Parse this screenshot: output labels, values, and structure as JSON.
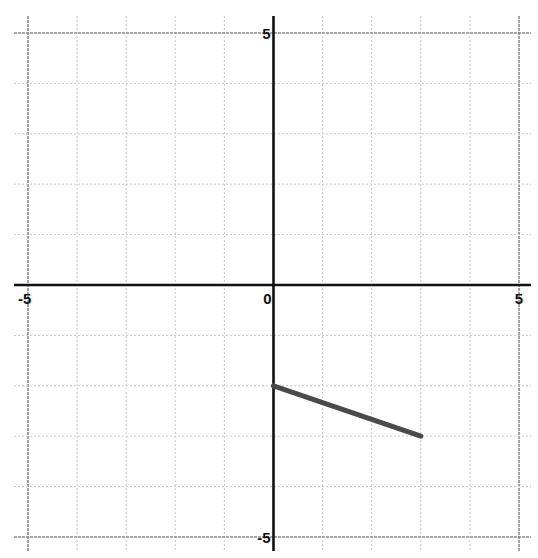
{
  "chart_data": {
    "type": "line",
    "title": "",
    "xlabel": "",
    "ylabel": "",
    "xlim": [
      -5,
      5
    ],
    "ylim": [
      -5,
      5
    ],
    "grid": true,
    "grid_step": 1,
    "x_tick_labels": [
      {
        "value": -5,
        "label": "-5"
      },
      {
        "value": 0,
        "label": "0"
      },
      {
        "value": 5,
        "label": "5"
      }
    ],
    "y_tick_labels": [
      {
        "value": 5,
        "label": "5"
      },
      {
        "value": -5,
        "label": "-5"
      }
    ],
    "series": [
      {
        "name": "segment",
        "x": [
          0,
          3
        ],
        "y": [
          -2,
          -3
        ],
        "color": "#4a4a4a",
        "width": 5
      }
    ]
  },
  "layout": {
    "x_min_px": 28,
    "x_max_px": 519,
    "y_top_px": 33,
    "y_bottom_px": 537,
    "grid_extent": {
      "left": 14,
      "right": 531,
      "top": 16,
      "bottom": 551
    },
    "colors": {
      "axis": "#111111",
      "grid": "#c8c8c8",
      "grid_outer": "#8a8a8a",
      "background": "#ffffff"
    }
  }
}
